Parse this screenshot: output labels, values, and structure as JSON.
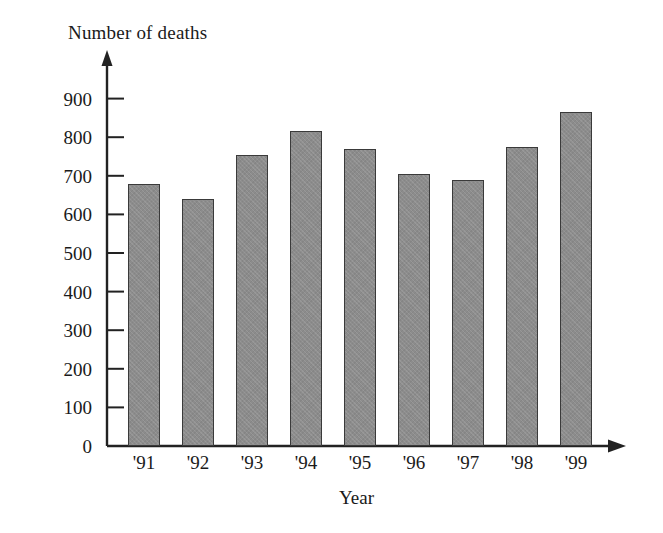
{
  "chart_data": {
    "type": "bar",
    "title": "",
    "xlabel": "Year",
    "ylabel": "Number of deaths",
    "categories": [
      "'91",
      "'92",
      "'93",
      "'94",
      "'95",
      "'96",
      "'97",
      "'98",
      "'99"
    ],
    "values": [
      680,
      640,
      755,
      817,
      770,
      705,
      690,
      775,
      865
    ],
    "ylim": [
      0,
      950
    ],
    "y_ticks": [
      0,
      100,
      200,
      300,
      400,
      500,
      600,
      700,
      800,
      900
    ],
    "y_tick_labels": [
      "0",
      "100",
      "200",
      "300",
      "400",
      "500",
      "600",
      "700",
      "800",
      "900"
    ],
    "grid": false,
    "legend": null,
    "bar_color": "#8c8c8c",
    "bar_edge_color": "#3a3a3a",
    "axis_color": "#222222",
    "background_color": "#ffffff",
    "axis_arrows": {
      "y_axis": "arrow-up",
      "x_axis": "arrow-right"
    }
  }
}
